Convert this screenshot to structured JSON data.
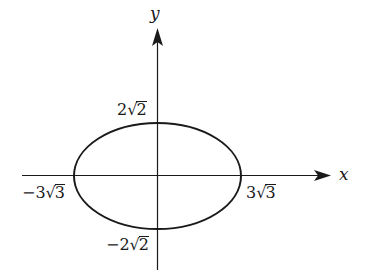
{
  "diagram": {
    "type": "ellipse-on-axes",
    "equation_semantics": "x^2/27 + y^2/8 = 1",
    "axes": {
      "x_label": "x",
      "y_label": "y"
    },
    "intercepts": {
      "x_neg": {
        "coef": "−3",
        "radicand": "3"
      },
      "x_pos": {
        "coef": "3",
        "radicand": "3"
      },
      "y_pos": {
        "coef": "2",
        "radicand": "2"
      },
      "y_neg": {
        "coef": "−2",
        "radicand": "2"
      }
    },
    "colors": {
      "stroke": "#1a1a1a",
      "background": "#ffffff"
    }
  }
}
